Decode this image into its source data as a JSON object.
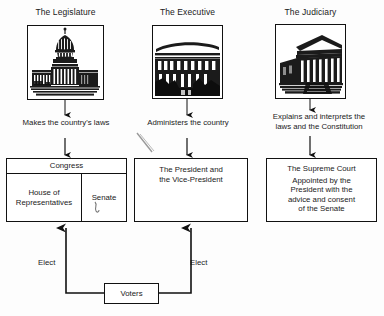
{
  "diagram": {
    "columns": [
      {
        "id": "legislature",
        "title": "The Legislature",
        "image": "us-capitol-building-image",
        "caption": "Makes the country's laws"
      },
      {
        "id": "executive",
        "title": "The Executive",
        "image": "white-house-building-image",
        "caption": "Administers the country"
      },
      {
        "id": "judiciary",
        "title": "The Judiciary",
        "image": "supreme-court-building-image",
        "caption_line1": "Explains and interprets the",
        "caption_line2": "laws and the Constitution"
      }
    ],
    "boxes": {
      "congress": {
        "header": "Congress",
        "left_cell_line1": "House of",
        "left_cell_line2": "Representatives",
        "right_cell": "Senate"
      },
      "president": {
        "line1": "The President and",
        "line2": "the Vice-President"
      },
      "supreme_court": {
        "line1": "The Supreme Court",
        "line2": "Appointed by the",
        "line3": "President with the",
        "line4": "advice and consent",
        "line5": "of the Senate"
      },
      "voters": {
        "label": "Voters"
      }
    },
    "connectors": {
      "elect_left": "Elect",
      "elect_right": "Elect"
    },
    "colors": {
      "ink": "#111111",
      "paper": "#fdfdfd",
      "text": "#1a1a1a"
    }
  }
}
